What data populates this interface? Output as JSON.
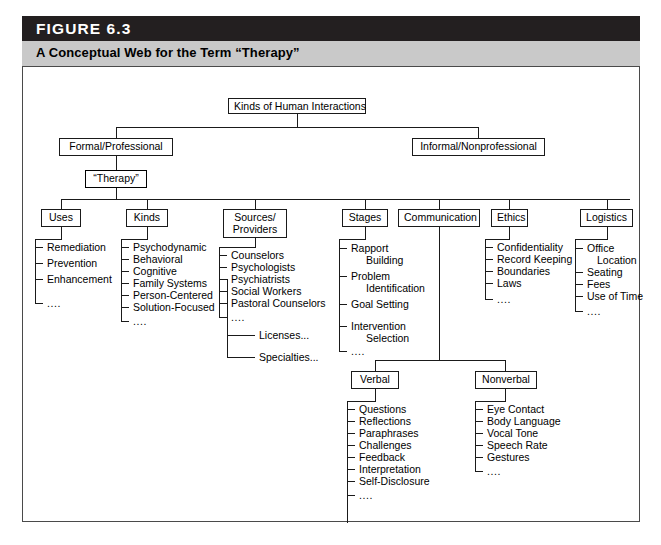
{
  "figure": {
    "number_label": "FIGURE 6.3",
    "title": "A Conceptual Web for the Term “Therapy”",
    "header_bar_color": "#231f20",
    "subtitle_bar_color": "#c9c9c9",
    "frame_color": "#4a4a4a"
  },
  "diagram": {
    "root": "Kinds of Human Interactions",
    "level1": {
      "left": "Formal/Professional",
      "right": "Informal/Nonprofessional"
    },
    "focus_node": "“Therapy”",
    "categories": [
      {
        "label": "Uses"
      },
      {
        "label": "Kinds"
      },
      {
        "label": "Sources/\nProviders",
        "line1": "Sources/",
        "line2": "Providers"
      },
      {
        "label": "Stages"
      },
      {
        "label": "Communication"
      },
      {
        "label": "Ethics"
      },
      {
        "label": "Logistics"
      }
    ],
    "ellipsis": "....",
    "lists": {
      "uses": [
        "Remediation",
        "Prevention",
        "Enhancement"
      ],
      "kinds": [
        "Psychodynamic",
        "Behavioral",
        "Cognitive",
        "Family Systems",
        "Person-Centered",
        "Solution-Focused"
      ],
      "sources_providers": [
        "Counselors",
        "Psychologists",
        "Psychiatrists",
        "Social Workers",
        "Pastoral Counselors"
      ],
      "sources_extra": [
        "Licenses...",
        "Specialties..."
      ],
      "stages": [
        {
          "line1": "Rapport",
          "line2": "Building"
        },
        {
          "line1": "Problem",
          "line2": "Identification"
        },
        {
          "line1": "Goal Setting",
          "line2": ""
        },
        {
          "line1": "Intervention",
          "line2": "Selection"
        }
      ],
      "ethics": [
        "Confidentiality",
        "Record Keeping",
        "Boundaries",
        "Laws"
      ],
      "logistics": [
        {
          "line1": "Office",
          "line2": "Location"
        },
        {
          "line1": "Seating",
          "line2": ""
        },
        {
          "line1": "Fees",
          "line2": ""
        },
        {
          "line1": "Use of Time",
          "line2": ""
        }
      ],
      "verbal": [
        "Questions",
        "Reflections",
        "Paraphrases",
        "Challenges",
        "Feedback",
        "Interpretation",
        "Self-Disclosure"
      ],
      "nonverbal": [
        "Eye Contact",
        "Body Language",
        "Vocal Tone",
        "Speech Rate",
        "Gestures"
      ]
    },
    "communication_children": {
      "verbal": "Verbal",
      "nonverbal": "Nonverbal"
    }
  }
}
